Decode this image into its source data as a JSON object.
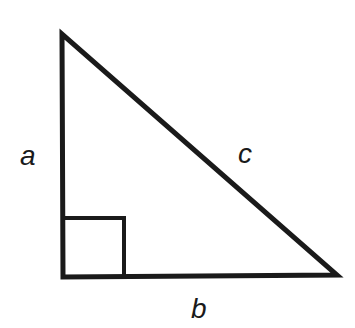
{
  "diagram": {
    "type": "right-triangle",
    "labels": {
      "vertical_leg": "a",
      "horizontal_leg": "b",
      "hypotenuse": "c"
    },
    "right_angle_marker": true,
    "colors": {
      "stroke": "#1a1a1a",
      "background": "#ffffff"
    }
  }
}
